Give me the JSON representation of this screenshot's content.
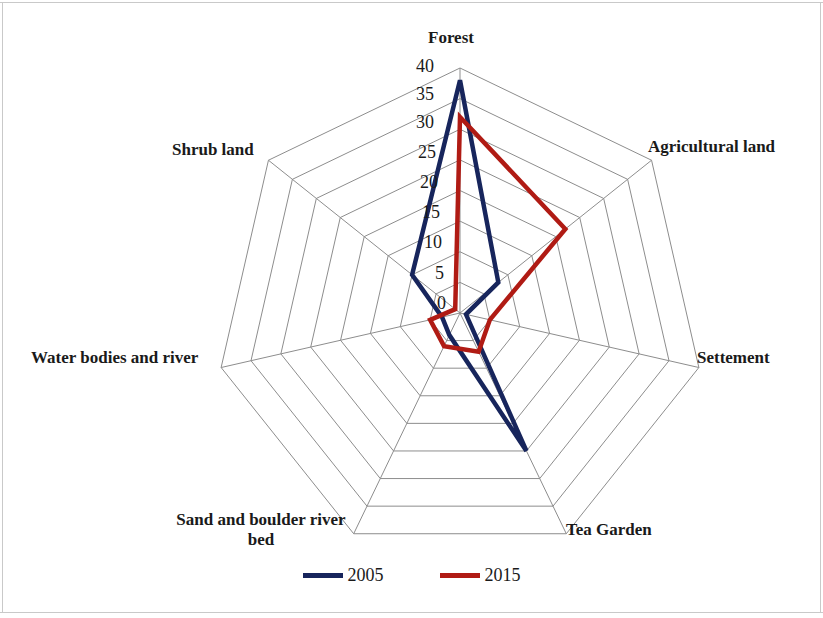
{
  "chart_data": {
    "type": "radar",
    "title": "",
    "categories": [
      "Forest",
      "Agricultural land",
      "Settement",
      "Tea Garden",
      "Sand and boulder river bed",
      "Water bodies and river",
      "Shrub land"
    ],
    "series": [
      {
        "name": "2005",
        "color": "#17255c",
        "values": [
          38,
          8,
          1,
          25,
          4,
          3,
          10
        ]
      },
      {
        "name": "2015",
        "color": "#b01b14",
        "values": [
          32,
          22,
          5,
          7,
          6,
          5,
          1
        ]
      }
    ],
    "tick_labels": [
      "0",
      "5",
      "10",
      "15",
      "20",
      "25",
      "30",
      "35",
      "40"
    ],
    "rlim": [
      0,
      40
    ],
    "rtick_step": 5,
    "grid": true,
    "legend_position": "bottom",
    "xlabel": "",
    "ylabel": ""
  },
  "axis_labels": {
    "forest": "Forest",
    "agricultural_land": "Agricultural land",
    "settement": "Settement",
    "tea_garden": "Tea Garden",
    "sand_bed_line1": "Sand and boulder river",
    "sand_bed_line2": "bed",
    "water_bodies": "Water bodies and river",
    "shrub_land": "Shrub land"
  },
  "ticks": {
    "t0": "0",
    "t5": "5",
    "t10": "10",
    "t15": "15",
    "t20": "20",
    "t25": "25",
    "t30": "30",
    "t35": "35",
    "t40": "40"
  },
  "legend": {
    "items": [
      {
        "label": "2005",
        "color": "#17255c"
      },
      {
        "label": "2015",
        "color": "#b01b14"
      }
    ],
    "item0_label": "2005",
    "item1_label": "2015"
  }
}
